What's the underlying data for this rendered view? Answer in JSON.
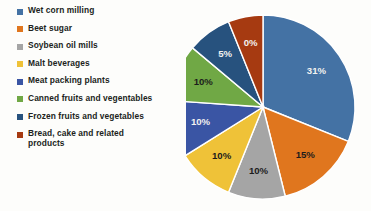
{
  "chart_data": {
    "type": "pie",
    "title": "",
    "subtitle": "",
    "xlabel": "",
    "ylabel": "",
    "legend_position": "left",
    "grid": false,
    "start_angle_deg": 0,
    "direction": "clockwise",
    "categories": [
      "Wet corn milling",
      "Beet sugar",
      "Soybean oil mills",
      "Malt beverages",
      "Meat packing plants",
      "Canned fruits and vegentables",
      "Frozen fruits and vegetables",
      "Bread, cake and related\nproducts"
    ],
    "values": [
      31,
      15,
      10,
      10,
      10,
      10,
      5,
      8
    ],
    "labels": [
      "31%",
      "15%",
      "10%",
      "10%",
      "10%",
      "10%",
      "5%",
      "0%"
    ],
    "colors": [
      "#4472a4",
      "#e0761e",
      "#a5a5a5",
      "#efc238",
      "#3a55a4",
      "#70a845",
      "#27527e",
      "#a63a11"
    ],
    "slice_angles_deg": [
      {
        "start": 0,
        "end": 112
      },
      {
        "start": 112,
        "end": 166
      },
      {
        "start": 166,
        "end": 202
      },
      {
        "start": 202,
        "end": 238
      },
      {
        "start": 238,
        "end": 274
      },
      {
        "start": 274,
        "end": 310
      },
      {
        "start": 310,
        "end": 338
      },
      {
        "start": 338,
        "end": 360
      }
    ]
  },
  "legend": {
    "items": [
      {
        "label": "Wet corn milling",
        "color": "#4472a4",
        "icon": "legend-swatch-icon"
      },
      {
        "label": "Beet sugar",
        "color": "#e0761e",
        "icon": "legend-swatch-icon"
      },
      {
        "label": "Soybean oil mills",
        "color": "#a5a5a5",
        "icon": "legend-swatch-icon"
      },
      {
        "label": "Malt beverages",
        "color": "#efc238",
        "icon": "legend-swatch-icon"
      },
      {
        "label": "Meat packing plants",
        "color": "#3a55a4",
        "icon": "legend-swatch-icon"
      },
      {
        "label": "Canned fruits and vegentables",
        "color": "#70a845",
        "icon": "legend-swatch-icon"
      },
      {
        "label": "Frozen fruits and vegetables",
        "color": "#27527e",
        "icon": "legend-swatch-icon"
      },
      {
        "label": "Bread, cake and related\nproducts",
        "color": "#a63a11",
        "icon": "legend-swatch-icon"
      }
    ]
  }
}
